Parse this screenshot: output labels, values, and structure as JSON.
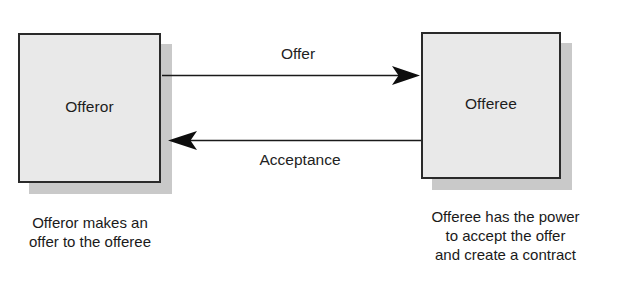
{
  "diagram": {
    "background_color": "#ffffff",
    "box_fill_color": "#e9e9e9",
    "box_border_color": "#2a2a2a",
    "box_shadow_color": "#c9c9c9",
    "text_color": "#1d1d1d",
    "arrow_color": "#1a1a1a",
    "nodes": [
      {
        "id": "offeror",
        "label": "Offeror",
        "caption_lines": [
          "Offeror makes an",
          "offer to the offeree"
        ]
      },
      {
        "id": "offeree",
        "label": "Offeree",
        "caption_lines": [
          "Offeree has the power",
          "to accept the offer",
          "and create a contract"
        ]
      }
    ],
    "edges": [
      {
        "id": "offer",
        "label": "Offer",
        "from": "offeror",
        "to": "offeree",
        "direction": "left-to-right",
        "label_position": "above"
      },
      {
        "id": "acceptance",
        "label": "Acceptance",
        "from": "offeree",
        "to": "offeror",
        "direction": "right-to-left",
        "label_position": "below"
      }
    ]
  }
}
